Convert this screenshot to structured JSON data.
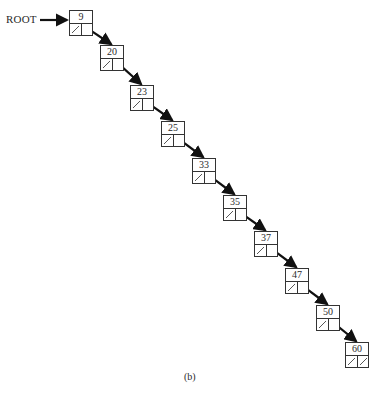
{
  "diagram": {
    "title_label": "ROOT",
    "caption": "(b)",
    "colors": {
      "line": "#333333",
      "arrow": "#111111",
      "background": "#ffffff"
    },
    "nodes": [
      {
        "key": "9",
        "x": 69,
        "y": 10,
        "left": "null",
        "right": "next"
      },
      {
        "key": "20",
        "x": 100,
        "y": 45,
        "left": "null",
        "right": "next"
      },
      {
        "key": "23",
        "x": 130,
        "y": 85,
        "left": "null",
        "right": "next"
      },
      {
        "key": "25",
        "x": 161,
        "y": 121,
        "left": "null",
        "right": "next"
      },
      {
        "key": "33",
        "x": 192,
        "y": 158,
        "left": "null",
        "right": "next"
      },
      {
        "key": "35",
        "x": 223,
        "y": 195,
        "left": "null",
        "right": "next"
      },
      {
        "key": "37",
        "x": 254,
        "y": 231,
        "left": "null",
        "right": "next"
      },
      {
        "key": "47",
        "x": 285,
        "y": 268,
        "left": "null",
        "right": "next"
      },
      {
        "key": "50",
        "x": 316,
        "y": 305,
        "left": "null",
        "right": "next"
      },
      {
        "key": "60",
        "x": 345,
        "y": 342,
        "left": "null",
        "right": "null"
      }
    ]
  }
}
